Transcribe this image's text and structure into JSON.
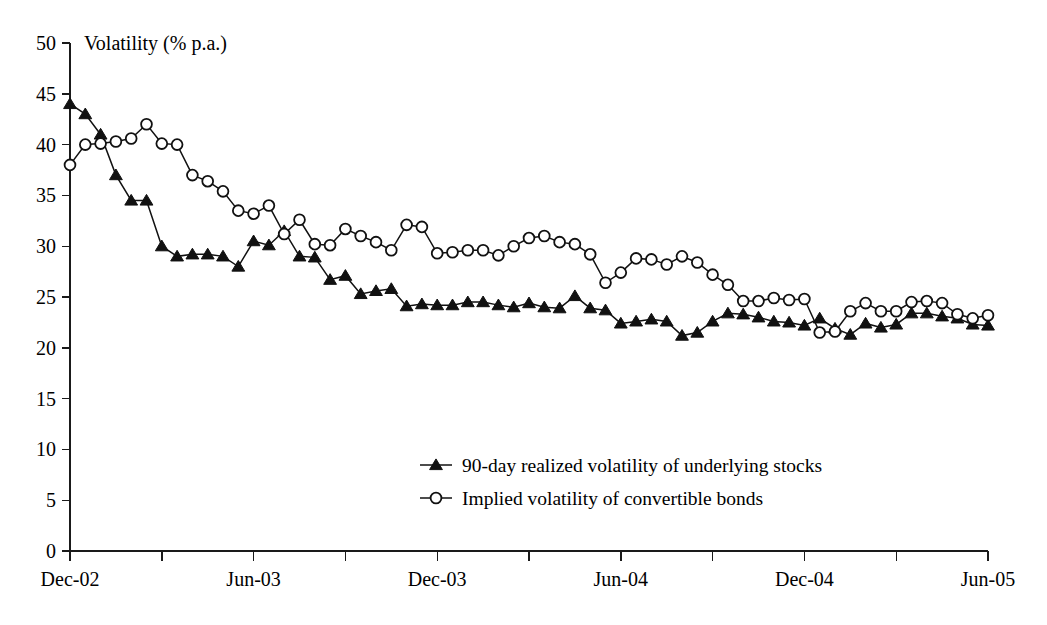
{
  "chart_data": {
    "type": "line",
    "title": "",
    "ylabel": "Volatility (% p.a.)",
    "xlabel": "",
    "ylim": [
      0,
      50
    ],
    "ytick_step": 5,
    "yticks": [
      0,
      5,
      10,
      15,
      20,
      25,
      30,
      35,
      40,
      45,
      50
    ],
    "ytick_labels": [
      "0",
      "5",
      "10",
      "15",
      "20",
      "25",
      "30",
      "35",
      "40",
      "45",
      "50"
    ],
    "xticks": [
      "Dec-02",
      "Jun-03",
      "Dec-03",
      "Jun-04",
      "Dec-04",
      "Jun-05"
    ],
    "x_minor_ticks_between": 1,
    "grid": false,
    "legend_position": "inside-center-lower",
    "x_start": "Dec-02",
    "x_end": "Jun-05",
    "x_interval": "semi-monthly",
    "n_points": 61,
    "series": [
      {
        "name": "90-day realized volatility of underlying stocks",
        "marker": "filled-triangle",
        "color": "#111111",
        "values": [
          44.0,
          43.0,
          41.0,
          37.0,
          34.5,
          34.5,
          30.0,
          29.0,
          29.2,
          29.2,
          29.0,
          28.0,
          30.5,
          30.1,
          31.5,
          29.0,
          28.9,
          26.7,
          27.1,
          25.3,
          25.6,
          25.8,
          24.1,
          24.3,
          24.2,
          24.2,
          24.5,
          24.5,
          24.2,
          24.0,
          24.4,
          24.0,
          23.9,
          25.1,
          23.9,
          23.7,
          22.4,
          22.6,
          22.8,
          22.6,
          21.2,
          21.5,
          22.6,
          23.4,
          23.3,
          23.0,
          22.6,
          22.5,
          22.2,
          22.9,
          21.9,
          21.3,
          22.4,
          22.0,
          22.3,
          23.4,
          23.4,
          23.1,
          22.9,
          22.3,
          22.2
        ]
      },
      {
        "name": "Implied volatility of convertible bonds",
        "marker": "open-circle",
        "color": "#111111",
        "values": [
          38.0,
          40.0,
          40.1,
          40.3,
          40.6,
          42.0,
          40.1,
          40.0,
          37.0,
          36.4,
          35.4,
          33.5,
          33.2,
          34.0,
          31.2,
          32.6,
          30.2,
          30.1,
          31.7,
          31.0,
          30.4,
          29.6,
          32.1,
          31.9,
          29.3,
          29.4,
          29.6,
          29.6,
          29.1,
          30.0,
          30.8,
          31.0,
          30.4,
          30.2,
          29.2,
          26.4,
          27.4,
          28.8,
          28.7,
          28.2,
          29.0,
          28.4,
          27.2,
          26.2,
          24.6,
          24.6,
          24.9,
          24.7,
          24.8,
          21.5,
          21.6,
          23.6,
          24.4,
          23.6,
          23.6,
          24.5,
          24.6,
          24.4,
          23.3,
          22.9,
          23.2
        ]
      }
    ]
  },
  "legend": {
    "entries": [
      {
        "label": "90-day realized volatility of underlying stocks",
        "marker": "filled-triangle"
      },
      {
        "label": "Implied volatility of convertible bonds",
        "marker": "open-circle"
      }
    ]
  }
}
